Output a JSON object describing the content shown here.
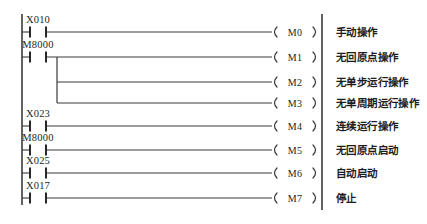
{
  "diagram": {
    "type": "plc-ladder-logic",
    "left_rail": {
      "x": 22,
      "y_top": 14,
      "y_bottom": 205
    },
    "right_rail": {
      "x": 322,
      "y_top": 14,
      "y_bottom": 210
    },
    "branch": {
      "x": 57,
      "y_top": 57,
      "y_bottom": 103
    },
    "contact": {
      "x_start": 30,
      "x_end": 46,
      "type": "normally-open"
    },
    "coil": {
      "x_start": 272,
      "x_end": 318,
      "text_x": 295
    },
    "label_x": 336,
    "rungs": [
      {
        "y": 32,
        "contact": "X010",
        "has_contact": true,
        "coil": "M0",
        "label": "手动操作",
        "wire_from": 46
      },
      {
        "y": 57,
        "contact": "M8000",
        "has_contact": true,
        "coil": "M1",
        "label": "无回原点操作",
        "wire_from": 46
      },
      {
        "y": 82,
        "contact": "",
        "has_contact": false,
        "coil": "M2",
        "label": "无单步运行操作",
        "wire_from": 57
      },
      {
        "y": 103,
        "contact": "",
        "has_contact": false,
        "coil": "M3",
        "label": "无单周期运行操作",
        "wire_from": 57
      },
      {
        "y": 126,
        "contact": "X023",
        "has_contact": true,
        "coil": "M4",
        "label": "连续运行操作",
        "wire_from": 46
      },
      {
        "y": 150,
        "contact": "M8000",
        "has_contact": true,
        "coil": "M5",
        "label": "无回原点启动",
        "wire_from": 46
      },
      {
        "y": 173,
        "contact": "X025",
        "has_contact": true,
        "coil": "M6",
        "label": "自动启动",
        "wire_from": 46
      },
      {
        "y": 198,
        "contact": "X017",
        "has_contact": true,
        "coil": "M7",
        "label": "停止",
        "wire_from": 46
      }
    ]
  },
  "colors": {
    "line": "#3a3a3c",
    "contact": "#1d1d1f",
    "text": "#231f20",
    "background": "#ffffff"
  }
}
